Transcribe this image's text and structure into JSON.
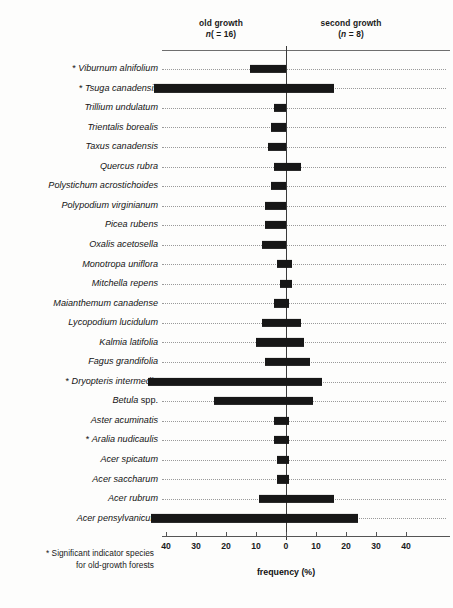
{
  "header": {
    "left_group": "old growth",
    "left_n": "(n = 16)",
    "right_group": "second growth",
    "right_n": "(n = 8)"
  },
  "axis": {
    "title": "frequency (%)",
    "tick_labels": [
      "40",
      "30",
      "20",
      "10",
      "0",
      "10",
      "20",
      "30",
      "40"
    ]
  },
  "footnote_line1": "* Significant indicator species",
  "footnote_line2": "for old-growth forests",
  "colors": {
    "bar": "#171717",
    "axis": "#555555",
    "leader": "#9a9a9a",
    "text": "#111111"
  },
  "chart_data": {
    "type": "bar",
    "orientation": "horizontal",
    "style": "diverging back-to-back (population pyramid)",
    "title": "",
    "xlabel": "frequency (%)",
    "ylabel": "",
    "xlim": [
      -45,
      45
    ],
    "xticks": [
      -40,
      -30,
      -20,
      -10,
      0,
      10,
      20,
      30,
      40
    ],
    "xticklabels": [
      "40",
      "30",
      "20",
      "10",
      "0",
      "10",
      "20",
      "30",
      "40"
    ],
    "grid": false,
    "legend_position": "top",
    "series": [
      {
        "name": "old growth",
        "n": 16,
        "side": "left"
      },
      {
        "name": "second growth",
        "n": 8,
        "side": "right"
      }
    ],
    "significance_marker": "*",
    "significance_note": "Significant indicator species for old-growth forests",
    "categories": [
      {
        "label": "Viburnum alnifolium",
        "significant": true,
        "old_growth": 12,
        "second_growth": 0
      },
      {
        "label": "Tsuga canadensis",
        "significant": true,
        "old_growth": 44,
        "second_growth": 16
      },
      {
        "label": "Trillium undulatum",
        "significant": false,
        "old_growth": 4,
        "second_growth": 0
      },
      {
        "label": "Trientalis borealis",
        "significant": false,
        "old_growth": 5,
        "second_growth": 0
      },
      {
        "label": "Taxus canadensis",
        "significant": false,
        "old_growth": 6,
        "second_growth": 0
      },
      {
        "label": "Quercus rubra",
        "significant": false,
        "old_growth": 4,
        "second_growth": 5
      },
      {
        "label": "Polystichum acrostichoides",
        "significant": false,
        "old_growth": 5,
        "second_growth": 0
      },
      {
        "label": "Polypodium virginianum",
        "significant": false,
        "old_growth": 7,
        "second_growth": 0
      },
      {
        "label": "Picea rubens",
        "significant": false,
        "old_growth": 7,
        "second_growth": 0
      },
      {
        "label": "Oxalis acetosella",
        "significant": false,
        "old_growth": 8,
        "second_growth": 0
      },
      {
        "label": "Monotropa uniflora",
        "significant": false,
        "old_growth": 3,
        "second_growth": 2
      },
      {
        "label": "Mitchella repens",
        "significant": false,
        "old_growth": 2,
        "second_growth": 2
      },
      {
        "label": "Maianthemum canadense",
        "significant": false,
        "old_growth": 4,
        "second_growth": 1
      },
      {
        "label": "Lycopodium lucidulum",
        "significant": false,
        "old_growth": 8,
        "second_growth": 5
      },
      {
        "label": "Kalmia latifolia",
        "significant": false,
        "old_growth": 10,
        "second_growth": 6
      },
      {
        "label": "Fagus grandifolia",
        "significant": false,
        "old_growth": 7,
        "second_growth": 8
      },
      {
        "label": "Dryopteris intermedia",
        "significant": true,
        "old_growth": 46,
        "second_growth": 12
      },
      {
        "label": "Betula spp.",
        "significant": false,
        "old_growth": 24,
        "second_growth": 9,
        "label_roman_tail": " spp."
      },
      {
        "label": "Aster acuminatis",
        "significant": false,
        "old_growth": 4,
        "second_growth": 1
      },
      {
        "label": "Aralia nudicaulis",
        "significant": true,
        "old_growth": 4,
        "second_growth": 1
      },
      {
        "label": "Acer spicatum",
        "significant": false,
        "old_growth": 3,
        "second_growth": 1
      },
      {
        "label": "Acer saccharum",
        "significant": false,
        "old_growth": 3,
        "second_growth": 1
      },
      {
        "label": "Acer rubrum",
        "significant": false,
        "old_growth": 9,
        "second_growth": 16
      },
      {
        "label": "Acer pensylvanicum",
        "significant": false,
        "old_growth": 45,
        "second_growth": 24
      }
    ]
  }
}
